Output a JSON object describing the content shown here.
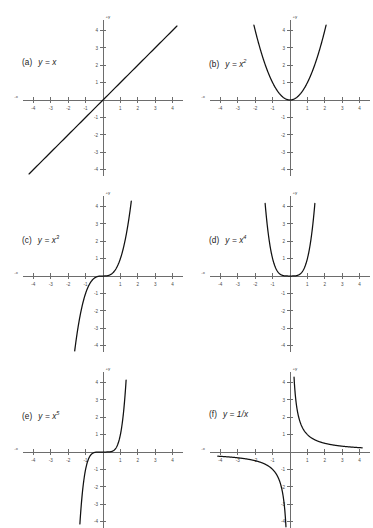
{
  "figure": {
    "background_color": "#ffffff",
    "axis_color": "#6d6d6d",
    "curve_color": "#111111",
    "panel_count": 6
  },
  "axes_common": {
    "x_end_positive_label": "+x",
    "x_end_negative_label": "-x",
    "y_end_positive_label": "+y",
    "y_end_negative_label": "-y",
    "x_tick_labels": [
      "-4",
      "-3",
      "-2",
      "-1",
      "1",
      "2",
      "3",
      "4"
    ],
    "y_tick_labels": [
      "4",
      "3",
      "2",
      "1",
      "-1",
      "-2",
      "-3",
      "-4"
    ],
    "xlim": [
      -4.6,
      4.6
    ],
    "ylim": [
      -4.6,
      4.6
    ],
    "grid": false
  },
  "panels": [
    {
      "tag": "(a)",
      "lhs": "y =",
      "base": "x",
      "exponent": "",
      "suffix": ""
    },
    {
      "tag": "(b)",
      "lhs": "y =",
      "base": "x",
      "exponent": "2",
      "suffix": ""
    },
    {
      "tag": "(c)",
      "lhs": "y =",
      "base": "x",
      "exponent": "3",
      "suffix": ""
    },
    {
      "tag": "(d)",
      "lhs": "y =",
      "base": "x",
      "exponent": "4",
      "suffix": ""
    },
    {
      "tag": "(e)",
      "lhs": "y =",
      "base": "x",
      "exponent": "5",
      "suffix": ""
    },
    {
      "tag": "(f)",
      "lhs": "y =",
      "base": "1/x",
      "exponent": "",
      "suffix": ""
    }
  ],
  "chart_data": [
    {
      "type": "line",
      "title": "(a) y = x",
      "function": "y = x",
      "xlabel": "+x",
      "ylabel": "+y",
      "xlim": [
        -4.6,
        4.6
      ],
      "ylim": [
        -4.6,
        4.6
      ],
      "xticks": [
        -4,
        -3,
        -2,
        -1,
        1,
        2,
        3,
        4
      ],
      "yticks": [
        4,
        3,
        2,
        1,
        -1,
        -2,
        -3,
        -4
      ],
      "grid": false,
      "x": [
        -4,
        -3,
        -2,
        -1,
        0,
        1,
        2,
        3,
        4
      ],
      "values": [
        -4,
        -3,
        -2,
        -1,
        0,
        1,
        2,
        3,
        4
      ]
    },
    {
      "type": "line",
      "title": "(b) y = x^2",
      "function": "y = x^2",
      "xlabel": "+x",
      "ylabel": "+y",
      "xlim": [
        -4.6,
        4.6
      ],
      "ylim": [
        -4.6,
        4.6
      ],
      "xticks": [
        -4,
        -3,
        -2,
        -1,
        1,
        2,
        3,
        4
      ],
      "yticks": [
        4,
        3,
        2,
        1,
        -1,
        -2,
        -3,
        -4
      ],
      "grid": false,
      "x": [
        -2,
        -1.5,
        -1,
        -0.5,
        0,
        0.5,
        1,
        1.5,
        2
      ],
      "values": [
        4,
        2.25,
        1,
        0.25,
        0,
        0.25,
        1,
        2.25,
        4
      ]
    },
    {
      "type": "line",
      "title": "(c) y = x^3",
      "function": "y = x^3",
      "xlabel": "+x",
      "ylabel": "+y",
      "xlim": [
        -4.6,
        4.6
      ],
      "ylim": [
        -4.6,
        4.6
      ],
      "xticks": [
        -4,
        -3,
        -2,
        -1,
        1,
        2,
        3,
        4
      ],
      "yticks": [
        4,
        3,
        2,
        1,
        -1,
        -2,
        -3,
        -4
      ],
      "grid": false,
      "x": [
        -1.587,
        -1.2,
        -1,
        -0.5,
        0,
        0.5,
        1,
        1.2,
        1.587
      ],
      "values": [
        -4,
        -1.728,
        -1,
        -0.125,
        0,
        0.125,
        1,
        1.728,
        4
      ]
    },
    {
      "type": "line",
      "title": "(d) y = x^4",
      "function": "y = x^4",
      "xlabel": "+x",
      "ylabel": "+y",
      "xlim": [
        -4.6,
        4.6
      ],
      "ylim": [
        -4.6,
        4.6
      ],
      "xticks": [
        -4,
        -3,
        -2,
        -1,
        1,
        2,
        3,
        4
      ],
      "yticks": [
        4,
        3,
        2,
        1,
        -1,
        -2,
        -3,
        -4
      ],
      "grid": false,
      "x": [
        -1.414,
        -1.2,
        -1,
        -0.5,
        0,
        0.5,
        1,
        1.2,
        1.414
      ],
      "values": [
        4,
        2.074,
        1,
        0.0625,
        0,
        0.0625,
        1,
        2.074,
        4
      ]
    },
    {
      "type": "line",
      "title": "(e) y = x^5",
      "function": "y = x^5",
      "xlabel": "+x",
      "ylabel": "+y",
      "xlim": [
        -4.6,
        4.6
      ],
      "ylim": [
        -4.6,
        4.6
      ],
      "xticks": [
        -4,
        -3,
        -2,
        -1,
        1,
        2,
        3,
        4
      ],
      "yticks": [
        4,
        3,
        2,
        1,
        -1,
        -2,
        -3,
        -4
      ],
      "grid": false,
      "x": [
        -1.32,
        -1.1,
        -1,
        -0.5,
        0,
        0.5,
        1,
        1.1,
        1.32
      ],
      "values": [
        -4,
        -1.61,
        -1,
        -0.03125,
        0,
        0.03125,
        1,
        1.61,
        4
      ]
    },
    {
      "type": "line",
      "title": "(f) y = 1/x",
      "function": "y = 1/x",
      "xlabel": "+x",
      "ylabel": "+y",
      "xlim": [
        -4.6,
        4.6
      ],
      "ylim": [
        -4.6,
        4.6
      ],
      "xticks": [
        -4,
        -3,
        -2,
        -1,
        1,
        2,
        3,
        4
      ],
      "yticks": [
        4,
        3,
        2,
        1,
        -1,
        -2,
        -3,
        -4
      ],
      "grid": false,
      "branches": [
        {
          "name": "right-branch",
          "x": [
            0.25,
            0.5,
            1,
            2,
            3,
            4
          ],
          "values": [
            4,
            2,
            1,
            0.5,
            0.333,
            0.25
          ]
        },
        {
          "name": "left-branch",
          "x": [
            -4,
            -3,
            -2,
            -1,
            -0.5,
            -0.25
          ],
          "values": [
            -0.25,
            -0.333,
            -0.5,
            -1,
            -2,
            -4
          ]
        }
      ]
    }
  ]
}
